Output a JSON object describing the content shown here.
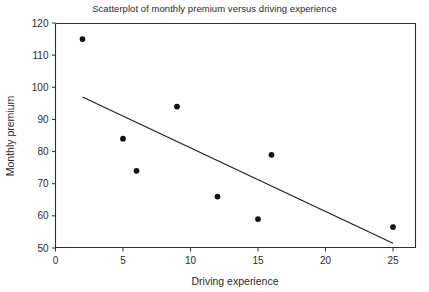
{
  "chart_data": {
    "type": "scatter",
    "title": "Scatterplot of monthly premium versus driving experience",
    "xlabel": "Driving experience",
    "ylabel": "Monthly premium",
    "xlim": [
      -0.5,
      26.7
    ],
    "ylim": [
      48.0,
      120.0
    ],
    "xticks": [
      0,
      5,
      10,
      15,
      20,
      25
    ],
    "xticklabels": [
      "0",
      "5",
      "10",
      "15",
      "20",
      "25"
    ],
    "yticks": [
      50,
      60,
      70,
      80,
      90,
      100,
      110,
      120
    ],
    "yticklabels": [
      "50",
      "60",
      "70",
      "80",
      "90",
      "100",
      "110",
      "120"
    ],
    "grid": false,
    "legend": null,
    "x": [
      2,
      5,
      6,
      9,
      12,
      15,
      16,
      25
    ],
    "y": [
      115,
      84,
      74,
      94,
      66,
      59,
      79,
      56.5
    ],
    "points": [
      {
        "x": 2,
        "y": 115
      },
      {
        "x": 5,
        "y": 84
      },
      {
        "x": 6,
        "y": 74
      },
      {
        "x": 9,
        "y": 94
      },
      {
        "x": 12,
        "y": 66
      },
      {
        "x": 15,
        "y": 59
      },
      {
        "x": 16,
        "y": 79
      },
      {
        "x": 25,
        "y": 56.5
      }
    ],
    "marker": {
      "shape": "circle",
      "size": 4.2,
      "color": "#111111"
    },
    "trendline": {
      "type": "linear-fit",
      "x_start": 2,
      "y_start": 97,
      "x_end": 25,
      "y_end": 51.5,
      "color": "#1d1d1d"
    }
  }
}
